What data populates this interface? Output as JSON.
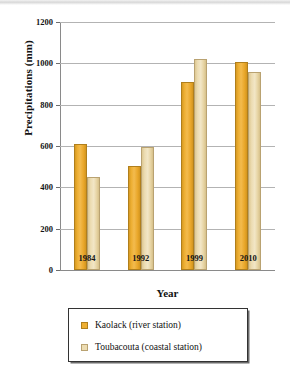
{
  "chart_data": {
    "type": "bar",
    "title": "",
    "categories": [
      "1984",
      "1992",
      "1999",
      "2010"
    ],
    "series": [
      {
        "name": "Kaolack (river station)",
        "color": "#eeaf32",
        "values": [
          610,
          505,
          912,
          1008
        ]
      },
      {
        "name": "Toubacouta (coastal station)",
        "color": "#ecdcb2",
        "values": [
          452,
          595,
          1020,
          958
        ]
      }
    ],
    "xlabel": "Year",
    "ylabel": "Precipitations (mm)",
    "ylim": [
      0,
      1200
    ],
    "yticks": [
      "0",
      "200",
      "400",
      "600",
      "800",
      "1000",
      "1200"
    ],
    "ytick_values": [
      0,
      200,
      400,
      600,
      800,
      1000,
      1200
    ],
    "grid": "horizontal",
    "legend_position": "bottom"
  }
}
